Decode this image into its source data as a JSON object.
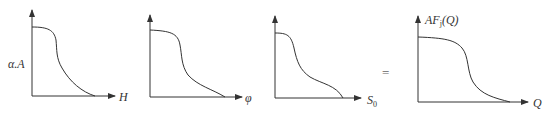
{
  "figure": {
    "panels": [
      {
        "id": "panel-1",
        "ylabel": "α.A",
        "xlabel": "H",
        "sub": ""
      },
      {
        "id": "panel-2",
        "ylabel": "",
        "xlabel": "φ",
        "sub": ""
      },
      {
        "id": "panel-3",
        "ylabel": "",
        "xlabel": "S",
        "sub": "0"
      },
      {
        "id": "panel-4",
        "ylabel_prefix": "AF",
        "ylabel_sub": "j",
        "ylabel_suffix": "(Q)",
        "xlabel": "Q",
        "sub": ""
      }
    ],
    "operator": "="
  }
}
